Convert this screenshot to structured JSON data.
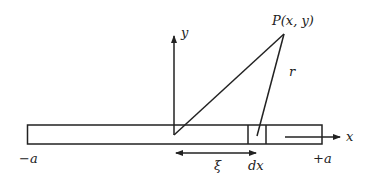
{
  "diagram": {
    "colors": {
      "stroke": "#222222",
      "background": "#ffffff"
    },
    "rod": {
      "left_label": "−a",
      "right_label": "+a"
    },
    "axes": {
      "x_label": "x",
      "y_label": "y"
    },
    "point": {
      "label": "P(x, y)"
    },
    "distance_label": "r",
    "element_label": "dx",
    "offset_label": "ξ"
  }
}
